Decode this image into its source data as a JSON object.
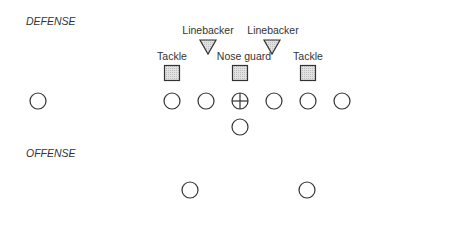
{
  "sections": {
    "defense": "DEFENSE",
    "offense": "OFFENSE"
  },
  "labels": [
    {
      "text": "Linebacker",
      "x": 208,
      "y": 25
    },
    {
      "text": "Linebacker",
      "x": 273,
      "y": 25
    },
    {
      "text": "Tackle",
      "x": 172,
      "y": 51
    },
    {
      "text": "Nose guard",
      "x": 242,
      "y": 51
    },
    {
      "text": "Tackle",
      "x": 308,
      "y": 51
    }
  ],
  "colors": {
    "stroke": "#333333",
    "fill": "#d4d4d4"
  },
  "defense_players": {
    "linebackers": [
      {
        "x": 208,
        "y": 46
      },
      {
        "x": 272,
        "y": 46
      }
    ],
    "linemen": [
      {
        "x": 172,
        "y": 73,
        "role": "Tackle"
      },
      {
        "x": 240,
        "y": 73,
        "role": "Nose guard"
      },
      {
        "x": 308,
        "y": 73,
        "role": "Tackle"
      }
    ]
  },
  "offense_players": {
    "line": [
      {
        "x": 38,
        "y": 101
      },
      {
        "x": 172,
        "y": 101
      },
      {
        "x": 206,
        "y": 101
      },
      {
        "x": 240,
        "y": 101,
        "center": true
      },
      {
        "x": 274,
        "y": 101
      },
      {
        "x": 308,
        "y": 101
      },
      {
        "x": 342,
        "y": 101
      }
    ],
    "backs": [
      {
        "x": 240,
        "y": 127
      },
      {
        "x": 190,
        "y": 190
      },
      {
        "x": 307,
        "y": 190
      }
    ]
  }
}
